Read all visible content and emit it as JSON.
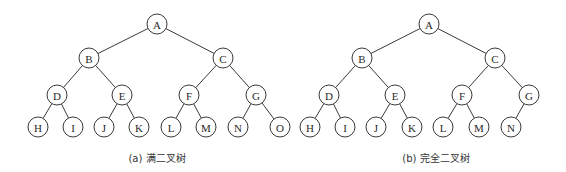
{
  "diagram": {
    "type": "binary-trees",
    "node_radius": 10,
    "colors": {
      "stroke": "#3a3a3a",
      "text": "#2a2a2a",
      "background": "#ffffff"
    },
    "trees": [
      {
        "id": "full",
        "caption": "(a) 满二叉树",
        "caption_x": 157,
        "nodes": [
          {
            "id": "A",
            "label": "A",
            "x": 157,
            "y": 24
          },
          {
            "id": "B",
            "label": "B",
            "x": 89,
            "y": 58
          },
          {
            "id": "C",
            "label": "C",
            "x": 223,
            "y": 58
          },
          {
            "id": "D",
            "label": "D",
            "x": 57,
            "y": 95
          },
          {
            "id": "E",
            "label": "E",
            "x": 122,
            "y": 95
          },
          {
            "id": "F",
            "label": "F",
            "x": 189,
            "y": 95
          },
          {
            "id": "G",
            "label": "G",
            "x": 256,
            "y": 95
          },
          {
            "id": "H",
            "label": "H",
            "x": 38,
            "y": 127
          },
          {
            "id": "I",
            "label": "I",
            "x": 73,
            "y": 127
          },
          {
            "id": "J",
            "label": "J",
            "x": 104,
            "y": 127
          },
          {
            "id": "K",
            "label": "K",
            "x": 139,
            "y": 127
          },
          {
            "id": "L",
            "label": "L",
            "x": 171,
            "y": 127
          },
          {
            "id": "M",
            "label": "M",
            "x": 206,
            "y": 127
          },
          {
            "id": "N",
            "label": "N",
            "x": 238,
            "y": 127
          },
          {
            "id": "O",
            "label": "O",
            "x": 280,
            "y": 127
          }
        ],
        "edges": [
          [
            "A",
            "B"
          ],
          [
            "A",
            "C"
          ],
          [
            "B",
            "D"
          ],
          [
            "B",
            "E"
          ],
          [
            "C",
            "F"
          ],
          [
            "C",
            "G"
          ],
          [
            "D",
            "H"
          ],
          [
            "D",
            "I"
          ],
          [
            "E",
            "J"
          ],
          [
            "E",
            "K"
          ],
          [
            "F",
            "L"
          ],
          [
            "F",
            "M"
          ],
          [
            "G",
            "N"
          ],
          [
            "G",
            "O"
          ]
        ]
      },
      {
        "id": "complete",
        "caption": "(b) 完全二叉树",
        "caption_x": 436,
        "nodes": [
          {
            "id": "A",
            "label": "A",
            "x": 429,
            "y": 24
          },
          {
            "id": "B",
            "label": "B",
            "x": 362,
            "y": 58
          },
          {
            "id": "C",
            "label": "C",
            "x": 495,
            "y": 58
          },
          {
            "id": "D",
            "label": "D",
            "x": 329,
            "y": 95
          },
          {
            "id": "E",
            "label": "E",
            "x": 395,
            "y": 95
          },
          {
            "id": "F",
            "label": "F",
            "x": 462,
            "y": 95
          },
          {
            "id": "G",
            "label": "G",
            "x": 529,
            "y": 95
          },
          {
            "id": "H",
            "label": "H",
            "x": 310,
            "y": 127
          },
          {
            "id": "I",
            "label": "I",
            "x": 345,
            "y": 127
          },
          {
            "id": "J",
            "label": "J",
            "x": 376,
            "y": 127
          },
          {
            "id": "K",
            "label": "K",
            "x": 412,
            "y": 127
          },
          {
            "id": "L",
            "label": "L",
            "x": 443,
            "y": 127
          },
          {
            "id": "M",
            "label": "M",
            "x": 479,
            "y": 127
          },
          {
            "id": "N",
            "label": "N",
            "x": 511,
            "y": 127
          }
        ],
        "edges": [
          [
            "A",
            "B"
          ],
          [
            "A",
            "C"
          ],
          [
            "B",
            "D"
          ],
          [
            "B",
            "E"
          ],
          [
            "C",
            "F"
          ],
          [
            "C",
            "G"
          ],
          [
            "D",
            "H"
          ],
          [
            "D",
            "I"
          ],
          [
            "E",
            "J"
          ],
          [
            "E",
            "K"
          ],
          [
            "F",
            "L"
          ],
          [
            "F",
            "M"
          ],
          [
            "G",
            "N"
          ]
        ]
      }
    ]
  }
}
